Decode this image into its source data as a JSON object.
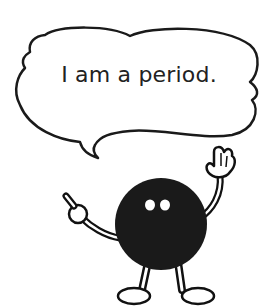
{
  "illustration": {
    "speech_bubble": {
      "text": "I am a period."
    },
    "character": {
      "name": "period-character",
      "body_color": "#1a1a1a",
      "outline_color": "#111111",
      "background_color": "#ffffff"
    }
  }
}
